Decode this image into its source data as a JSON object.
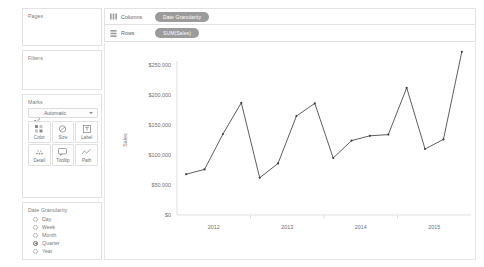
{
  "sidebar": {
    "cards": [
      {
        "title": "Pages"
      },
      {
        "title": "Filters"
      },
      {
        "title": "Marks"
      },
      {
        "title": "Date Granularity"
      }
    ],
    "marks": {
      "mark_type": "Automatic",
      "mark_type_icon": "automatic-line-icon",
      "caret_icon": "chevron-down-icon",
      "buttons": [
        {
          "label": "Color",
          "icon": "color-squares-icon"
        },
        {
          "label": "Size",
          "icon": "size-circle-icon"
        },
        {
          "label": "Label",
          "icon": "label-text-icon"
        },
        {
          "label": "Detail",
          "icon": "detail-dots-icon"
        },
        {
          "label": "Tooltip",
          "icon": "tooltip-bubble-icon"
        },
        {
          "label": "Path",
          "icon": "path-line-icon"
        }
      ]
    },
    "granularity": {
      "options": [
        {
          "label": "Day",
          "selected": false
        },
        {
          "label": "Week",
          "selected": false
        },
        {
          "label": "Month",
          "selected": false
        },
        {
          "label": "Quarter",
          "selected": true
        },
        {
          "label": "Year",
          "selected": false
        }
      ]
    }
  },
  "shelves": [
    {
      "name": "Columns",
      "icon": "columns-icon",
      "pill": "Date Granularity"
    },
    {
      "name": "Rows",
      "icon": "rows-icon",
      "pill": "SUM(Sales)"
    }
  ],
  "colors": {
    "pill_fill": "#9b9b9b",
    "pill_text": "#ffffff",
    "line": "#4c4c4c",
    "panel_border": "#e2e2e2",
    "text": "#6f6f6f"
  },
  "chart_data": {
    "type": "line",
    "title": "",
    "xlabel": "",
    "ylabel": "Sales",
    "ylim": [
      0,
      250000
    ],
    "yticks": [
      0,
      50000,
      100000,
      150000,
      200000,
      250000
    ],
    "ytick_labels": [
      "$0",
      "$50,000",
      "$100,000",
      "$150,000",
      "$200,000",
      "$250,000"
    ],
    "xticks": [
      "2012",
      "2013",
      "2014",
      "2015"
    ],
    "grid": false,
    "legend": "none",
    "x": [
      "2012 Q1",
      "2012 Q2",
      "2012 Q3",
      "2012 Q4",
      "2013 Q1",
      "2013 Q2",
      "2013 Q3",
      "2013 Q4",
      "2014 Q1",
      "2014 Q2",
      "2014 Q3",
      "2014 Q4",
      "2015 Q1",
      "2015 Q2",
      "2015 Q3",
      "2015 Q4"
    ],
    "values": [
      68000,
      76000,
      135000,
      187000,
      62000,
      86000,
      165000,
      186000,
      95000,
      124000,
      132000,
      134000,
      212000,
      110000,
      126000,
      272000
    ]
  }
}
